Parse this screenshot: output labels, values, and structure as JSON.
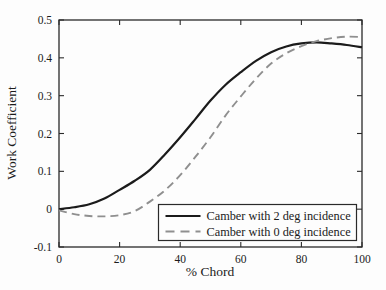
{
  "figure": {
    "background": "#fdfdfd",
    "frame_color": "#2a2a2a",
    "text_color": "#1b1b1b"
  },
  "chart_data": {
    "type": "line",
    "title": "",
    "xlabel": "% Chord",
    "ylabel": "Work Coefficient",
    "xlim": [
      0,
      100
    ],
    "ylim": [
      -0.1,
      0.5
    ],
    "xticks": [
      0,
      20,
      40,
      60,
      80,
      100
    ],
    "xtick_labels": [
      "0",
      "20",
      "40",
      "60",
      "80",
      "100"
    ],
    "yticks": [
      -0.1,
      0,
      0.1,
      0.2,
      0.3,
      0.4,
      0.5
    ],
    "ytick_labels": [
      "-0.1",
      "0",
      "0.1",
      "0.2",
      "0.3",
      "0.4",
      "0.5"
    ],
    "grid": false,
    "legend_position": "inside-bottom-right",
    "x": [
      0,
      5,
      10,
      15,
      20,
      25,
      30,
      35,
      40,
      45,
      50,
      55,
      60,
      65,
      70,
      75,
      80,
      85,
      90,
      95,
      100
    ],
    "series": [
      {
        "name": "Camber with 2 deg incidence",
        "line_style": "solid",
        "color": "#1b1b1b",
        "values": [
          0.0,
          0.005,
          0.013,
          0.028,
          0.051,
          0.075,
          0.104,
          0.145,
          0.19,
          0.238,
          0.287,
          0.329,
          0.362,
          0.392,
          0.415,
          0.43,
          0.438,
          0.441,
          0.438,
          0.434,
          0.428
        ]
      },
      {
        "name": "Camber with 0 deg incidence",
        "line_style": "dashed",
        "color": "#8f8f8f",
        "values": [
          -0.003,
          -0.013,
          -0.018,
          -0.019,
          -0.016,
          -0.005,
          0.02,
          0.05,
          0.09,
          0.138,
          0.19,
          0.248,
          0.298,
          0.345,
          0.385,
          0.412,
          0.431,
          0.444,
          0.452,
          0.456,
          0.455
        ]
      }
    ]
  }
}
